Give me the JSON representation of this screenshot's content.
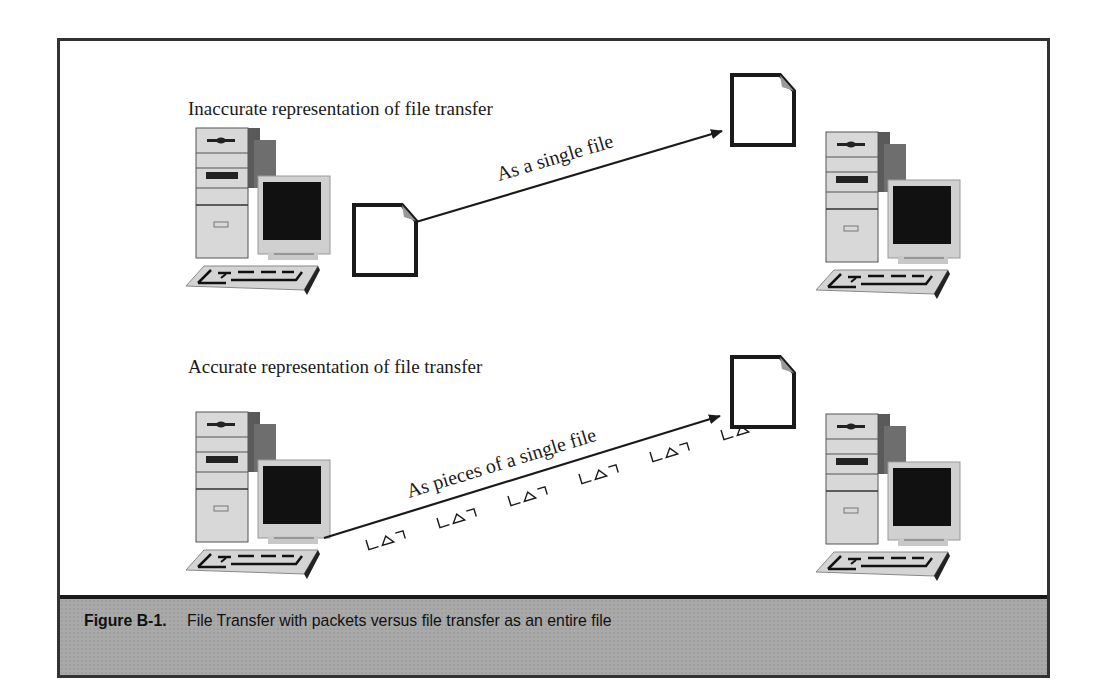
{
  "figure": {
    "number": "Figure B-1.",
    "caption": "File Transfer with packets versus file transfer as an entire file"
  },
  "panels": [
    {
      "title": "Inaccurate representation of file transfer",
      "arrow_label": "As a single file",
      "source": "computer-icon",
      "destination": "computer-icon",
      "payload": "single-file"
    },
    {
      "title": "Accurate representation of file transfer",
      "arrow_label": "As pieces of a single file",
      "source": "computer-icon",
      "destination": "computer-icon",
      "payload": "packets",
      "packet_count": 6
    }
  ],
  "colors": {
    "frame": "#333333",
    "caption_band": "#a9a9a9",
    "ink": "#1a1a1a"
  }
}
